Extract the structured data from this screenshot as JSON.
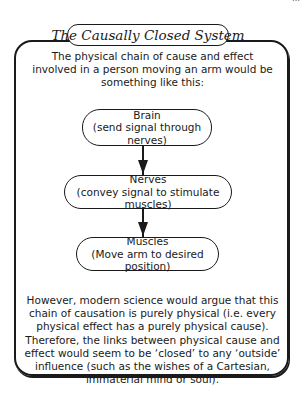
{
  "corner_fragment": "…",
  "title": "The Causally Closed System",
  "intro": "The physical chain of cause and effect involved in a person moving an arm would be something like this:",
  "flow": {
    "nodes": [
      {
        "heading": "Brain",
        "detail": "(send signal through nerves)"
      },
      {
        "heading": "Nerves",
        "detail": "(convey signal to stimulate muscles)"
      },
      {
        "heading": "Muscles",
        "detail": "(Move arm to desired position)"
      }
    ],
    "arrows": [
      "down-arrow",
      "down-arrow"
    ]
  },
  "conclusion": "However, modern science would argue that this chain of causation is purely physical (i.e. every physical effect has a purely physical cause). Therefore, the links between physical cause and effect would seem to be ‘closed’ to any ‘outside’ influence (such as the wishes of a Cartesian, immaterial mind or soul).",
  "colors": {
    "ink": "#1a1a1a",
    "background": "#ffffff"
  }
}
